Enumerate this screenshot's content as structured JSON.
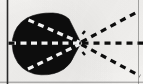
{
  "figure": {
    "background_color": "#f6f5f3",
    "ink_color": "#0d0d0d",
    "highlight_color": "#ffffff",
    "canvas": {
      "width": 143,
      "height": 84
    },
    "borders": {
      "left_rule": {
        "x": 7.5,
        "y1": 0,
        "y2": 84,
        "width": 1.6,
        "color": "#1a1a1a",
        "opacity": 0.92
      },
      "right_rule": {
        "x": 138.5,
        "y1": 0,
        "y2": 84,
        "width": 1.0,
        "color": "#3a3a3a",
        "opacity": 0.42
      },
      "bottom_rule": {
        "y": 82.2,
        "x1": 0,
        "x2": 143,
        "width": 1.0,
        "color": "#3a3a3a",
        "opacity": 0.5
      }
    },
    "blob": {
      "label": "solid black occluder",
      "fill": "#0d0d0d",
      "bounds": {
        "x_min": 12,
        "x_max": 82,
        "y_min": 13,
        "y_max": 75
      },
      "apex": {
        "x": 81,
        "y": 43
      },
      "path": "M 81 43 L 69 19 Q 63 13.5 53 13 Q 38 12.5 27 18 Q 15 25 12.6 39 Q 10.8 52 18 63 Q 26 74 41 74.8 Q 54 75.4 64 69 Q 71 64 74 56 Z"
    },
    "interior_rays": {
      "label": "white dashed rays inside occluder",
      "stroke": "#ffffff",
      "stroke_width": 3.2,
      "dash_pattern": "6 4.5",
      "lines": [
        {
          "name": "upper-interior-ray",
          "x1": 28.5,
          "y1": 20.0,
          "x2": 79.5,
          "y2": 42.2
        },
        {
          "name": "center-interior-ray",
          "x1": 10.0,
          "y1": 43.2,
          "x2": 79.5,
          "y2": 43.2
        },
        {
          "name": "lower-interior-ray",
          "x1": 28.0,
          "y1": 69.0,
          "x2": 79.5,
          "y2": 44.4
        }
      ]
    },
    "exterior_rays": {
      "label": "black dashed rays outside occluder",
      "stroke": "#0d0d0d",
      "stroke_width": 3.2,
      "dash_pattern": "6 5",
      "lines": [
        {
          "name": "upper-exterior-ray",
          "x1": 81.5,
          "y1": 42.0,
          "x2": 139.0,
          "y2": 11.0
        },
        {
          "name": "center-exterior-ray",
          "x1": 82.5,
          "y1": 43.2,
          "x2": 143.0,
          "y2": 43.2
        },
        {
          "name": "lower-exterior-ray",
          "x1": 81.5,
          "y1": 44.5,
          "x2": 140.0,
          "y2": 76.0
        }
      ]
    },
    "apex_marks": {
      "label": "short convergence ticks at apex",
      "stroke": "#0d0d0d",
      "stroke_width": 2.4,
      "lines": [
        {
          "name": "apex-tick-upper",
          "x1": 82.5,
          "y1": 34.0,
          "x2": 85.0,
          "y2": 31.0
        },
        {
          "name": "apex-tick-lower",
          "x1": 82.5,
          "y1": 52.0,
          "x2": 85.0,
          "y2": 55.0
        }
      ]
    }
  }
}
